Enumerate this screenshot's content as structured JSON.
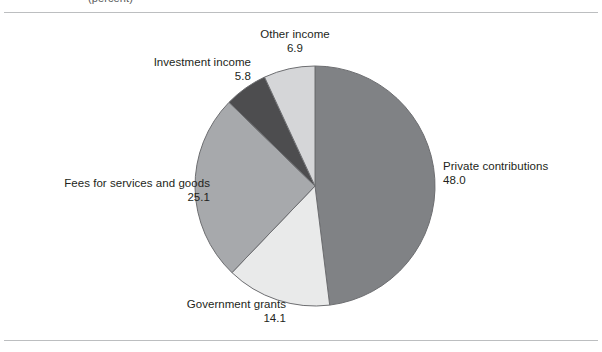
{
  "figure": {
    "clipped_header_text": "(percent)",
    "rules": {
      "color": "#bcbec0"
    }
  },
  "chart_data": {
    "type": "pie",
    "title": "",
    "subtitle": "",
    "xlabel": "",
    "ylabel": "",
    "units": "percent",
    "legend_position": "none",
    "grid": false,
    "start_angle_deg": 0,
    "direction": "clockwise",
    "total": 99.9,
    "categories": [
      "Private contributions",
      "Government grants",
      "Fees for services and goods",
      "Investment income",
      "Other income"
    ],
    "values": [
      48.0,
      14.1,
      25.1,
      5.8,
      6.9
    ],
    "value_labels": [
      "48.0",
      "14.1",
      "25.1",
      "5.8",
      "6.9"
    ],
    "colors": [
      "#808285",
      "#e9eaea",
      "#a7a9ac",
      "#4d4d4f",
      "#d5d6d8"
    ],
    "slice_outline_color": "#6d6e71",
    "slices": [
      {
        "name": "Private contributions",
        "value": 48.0,
        "value_label": "48.0",
        "color": "#808285",
        "label_align": "left",
        "start_deg": 0.0,
        "end_deg": 172.97
      },
      {
        "name": "Government grants",
        "value": 14.1,
        "value_label": "14.1",
        "color": "#e9eaea",
        "label_align": "right",
        "start_deg": 172.97,
        "end_deg": 223.78
      },
      {
        "name": "Fees for services and goods",
        "value": 25.1,
        "value_label": "25.1",
        "color": "#a7a9ac",
        "label_align": "right",
        "start_deg": 223.78,
        "end_deg": 314.23
      },
      {
        "name": "Investment income",
        "value": 5.8,
        "value_label": "5.8",
        "color": "#4d4d4f",
        "label_align": "right",
        "start_deg": 314.23,
        "end_deg": 335.14
      },
      {
        "name": "Other income",
        "value": 6.9,
        "value_label": "6.9",
        "color": "#d5d6d8",
        "label_align": "center",
        "start_deg": 335.14,
        "end_deg": 360.0
      }
    ]
  }
}
